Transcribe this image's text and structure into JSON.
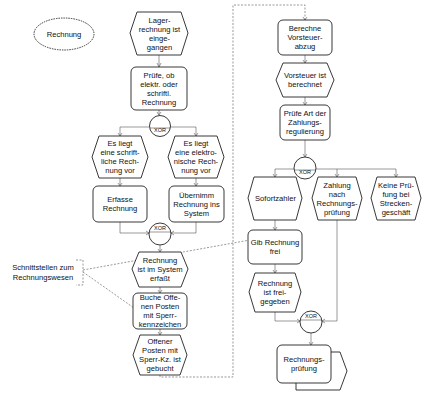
{
  "diagram": {
    "type": "EPC (Ereignisgesteuerte Prozesskette)",
    "colors": {
      "stroke": "#222222",
      "edge": "#555555",
      "background": "#ffffff"
    },
    "nodes": {
      "rechnung_object": "Rechnung",
      "ev_lagerrechnung": "Lager-\nrechnung ist\neinge-\ngangen",
      "fn_pruefe_art": "Prüfe, ob\nelektr. oder\nschriftl.\nRechnung",
      "xor1": "XOR",
      "ev_schriftlich": "Es liegt\neine schrift-\nliche Rech-\nnung vor",
      "ev_elektronisch": "Es liegt\neine elektro-\nnische Rech-\nnung vor",
      "fn_erfasse": "Erfasse\nRechnung",
      "fn_uebernimm": "Übernimm\nRechnung ins\nSystem",
      "xor2": "XOR",
      "ev_im_system": "Rechnung\nist im System\nerfaßt",
      "fn_buche": "Buche  Offe-\nnen Posten\nmit Sperr-\nkennzeichen",
      "ev_gebucht": "Offener\nPosten mit\nSperr-Kz. ist\ngebucht",
      "fn_vorsteuer": "Berechne\nVorsteuer-\nabzug",
      "ev_vorsteuer": "Vorsteuer ist\nberechnet",
      "fn_zahlungsregulierung": "Prüfe Art der\nZahlungs-\nregulierung",
      "xor3": "XOR",
      "ev_sofortzahler": "Sofortzahler",
      "ev_zahlung_nach": "Zahlung\nnach\nRechnungs-\nprüfung",
      "ev_keine_pruefung": "Keine Prü-\nfung bei\nStrecken-\ngeschäft",
      "fn_gib_frei": "Gib Rechnung\nfrei",
      "ev_freigegeben": "Rechnung\nist frei-\ngegeben",
      "xor4": "XOR",
      "pi_rechnungspruefung": "Rechnungs-\nprüfung"
    },
    "annotation": {
      "text": "Schnittstellen zum\nRechnungswesen"
    }
  }
}
